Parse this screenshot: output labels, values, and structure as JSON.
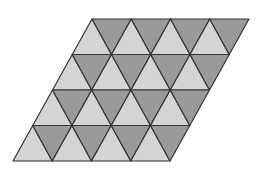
{
  "diagram": {
    "type": "triangular-tiling-parallelogram",
    "rows": 4,
    "up_triangles_per_row": 4,
    "down_triangles_per_row": 4,
    "top_left": [
      92,
      19
    ],
    "top_right": [
      249,
      19
    ],
    "bottom_left": [
      13,
      161
    ],
    "bottom_right": [
      171,
      161
    ],
    "colors": {
      "background": "#ffffff",
      "up_triangle_fill": "#d4d4d4",
      "down_triangle_fill": "#9a9a9a",
      "stroke": "#333333"
    },
    "stroke_width": 1.2
  }
}
